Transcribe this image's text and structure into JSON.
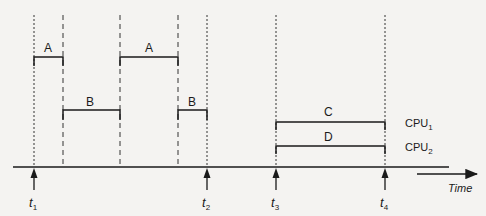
{
  "diagram": {
    "type": "timing-diagram",
    "time_axis_label": "Time",
    "time_markers": [
      {
        "id": "t1",
        "base": "t",
        "sub": "1",
        "x": 34
      },
      {
        "id": "t2",
        "base": "t",
        "sub": "2",
        "x": 207
      },
      {
        "id": "t3",
        "base": "t",
        "sub": "3",
        "x": 276
      },
      {
        "id": "t4",
        "base": "t",
        "sub": "4",
        "x": 385
      }
    ],
    "single_cpu_segments": [
      {
        "label": "A",
        "start": 34,
        "end": 63,
        "level": "high"
      },
      {
        "label": "B",
        "start": 63,
        "end": 120,
        "level": "low"
      },
      {
        "label": "A",
        "start": 120,
        "end": 178,
        "level": "high"
      },
      {
        "label": "B",
        "start": 178,
        "end": 207,
        "level": "low"
      }
    ],
    "multi_cpu_segments": [
      {
        "label": "C",
        "cpu_base": "CPU",
        "cpu_sub": "1",
        "start": 276,
        "end": 385
      },
      {
        "label": "D",
        "cpu_base": "CPU",
        "cpu_sub": "2",
        "start": 276,
        "end": 385
      }
    ],
    "colors": {
      "line": "#1a1a1a",
      "background": "#f4f3f1"
    }
  }
}
